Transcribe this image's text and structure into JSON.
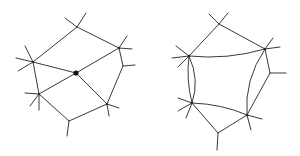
{
  "figures": [
    {
      "name": "left-graph",
      "description": "Planar graph with central marked vertex and spokes",
      "vertices": {
        "top": [
          77,
          27
        ],
        "left": [
          33,
          62
        ],
        "center": [
          76,
          73
        ],
        "upper_right": [
          119,
          48
        ],
        "right_small": [
          123,
          66
        ],
        "lower_left": [
          39,
          94
        ],
        "lower_right": [
          107,
          104
        ],
        "bottom": [
          69,
          121
        ]
      },
      "edges": [
        [
          "top",
          "left"
        ],
        [
          "top",
          "upper_right"
        ],
        [
          "left",
          "center"
        ],
        [
          "center",
          "upper_right"
        ],
        [
          "left",
          "lower_left"
        ],
        [
          "center",
          "lower_left"
        ],
        [
          "center",
          "lower_right"
        ],
        [
          "upper_right",
          "right_small"
        ],
        [
          "right_small",
          "lower_right"
        ],
        [
          "lower_left",
          "bottom"
        ],
        [
          "bottom",
          "lower_right"
        ]
      ]
    },
    {
      "name": "right-graph",
      "description": "Graph with curved (digon) edges replacing the central vertex",
      "vertices": {
        "top": [
          219,
          24
        ],
        "left_top": [
          189,
          56
        ],
        "right_top": [
          265,
          49
        ],
        "right_small": [
          270,
          73
        ],
        "left_bottom": [
          192,
          103
        ],
        "right_bottom": [
          247,
          115
        ],
        "bottom": [
          218,
          133
        ]
      }
    }
  ],
  "colors": {
    "stroke": "#3a3a3a",
    "vertex": "#2a2a2a",
    "background": "#ffffff"
  }
}
